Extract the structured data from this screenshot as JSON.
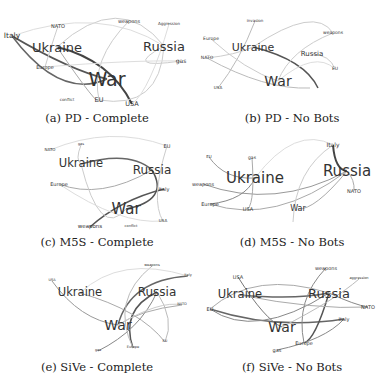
{
  "panels": [
    {
      "id": "a",
      "caption": "(a) PD - Complete",
      "nodes": [
        {
          "label": "Italy",
          "x": 12,
          "y": 36,
          "size": 7.5
        },
        {
          "label": "NATO",
          "x": 58,
          "y": 26,
          "size": 5
        },
        {
          "label": "weapons",
          "x": 129,
          "y": 21,
          "size": 5
        },
        {
          "label": "Aggression",
          "x": 169,
          "y": 24,
          "size": 4
        },
        {
          "label": "Ukraine",
          "x": 57,
          "y": 47,
          "size": 13
        },
        {
          "label": "Russia",
          "x": 164,
          "y": 46,
          "size": 13
        },
        {
          "label": "gas",
          "x": 181,
          "y": 61,
          "size": 6
        },
        {
          "label": "Europe",
          "x": 45,
          "y": 67,
          "size": 5
        },
        {
          "label": "War",
          "x": 107,
          "y": 79,
          "size": 19
        },
        {
          "label": "conflict",
          "x": 67,
          "y": 100,
          "size": 4
        },
        {
          "label": "EU",
          "x": 99,
          "y": 100,
          "size": 6.5
        },
        {
          "label": "USA",
          "x": 132,
          "y": 104,
          "size": 6.5
        }
      ],
      "edges": [
        {
          "d": "M12,36 Q70,70 107,79",
          "w": 2,
          "c": "#555"
        },
        {
          "d": "M12,36 Q60,100 107,79",
          "w": 1.5,
          "c": "#666"
        },
        {
          "d": "M57,47 Q110,60 132,104",
          "w": 2,
          "c": "#444"
        },
        {
          "d": "M57,47 Q120,-10 164,46",
          "w": 1,
          "c": "#ccc"
        },
        {
          "d": "M57,47 Q100,110 99,100",
          "w": 1,
          "c": "#aaa"
        },
        {
          "d": "M164,46 Q120,70 181,61",
          "w": 1,
          "c": "#ccc"
        },
        {
          "d": "M164,46 Q160,110 99,100",
          "w": 1,
          "c": "#ccc"
        },
        {
          "d": "M129,21 Q90,60 99,100",
          "w": 1,
          "c": "#ccc"
        },
        {
          "d": "M45,67 Q130,60 181,61",
          "w": 1,
          "c": "#ddd"
        },
        {
          "d": "M58,26 Q50,50 45,67",
          "w": 1,
          "c": "#ccc"
        },
        {
          "d": "M169,24 Q150,90 132,104",
          "w": 1,
          "c": "#ddd"
        },
        {
          "d": "M12,36 Q100,5 164,46",
          "w": 1,
          "c": "#ddd"
        }
      ]
    },
    {
      "id": "b",
      "caption": "(b) PD - No Bots",
      "nodes": [
        {
          "label": "invasion",
          "x": 60,
          "y": 21,
          "size": 4
        },
        {
          "label": "weapons",
          "x": 138,
          "y": 33,
          "size": 4.5
        },
        {
          "label": "Europe",
          "x": 16,
          "y": 39,
          "size": 4.5
        },
        {
          "label": "Ukraine",
          "x": 58,
          "y": 47,
          "size": 11
        },
        {
          "label": "Russia",
          "x": 117,
          "y": 54,
          "size": 7
        },
        {
          "label": "NATO",
          "x": 12,
          "y": 58,
          "size": 4.5
        },
        {
          "label": "EU",
          "x": 140,
          "y": 69,
          "size": 4.5
        },
        {
          "label": "War",
          "x": 83,
          "y": 81,
          "size": 14
        },
        {
          "label": "USA",
          "x": 23,
          "y": 88,
          "size": 4
        }
      ],
      "edges": [
        {
          "d": "M58,47 Q110,60 123,88",
          "w": 1.5,
          "c": "#555"
        },
        {
          "d": "M58,47 Q120,5 138,33",
          "w": 1,
          "c": "#ccc"
        },
        {
          "d": "M60,21 Q45,60 23,88",
          "w": 1,
          "c": "#bbb"
        },
        {
          "d": "M16,39 Q50,70 83,81",
          "w": 1,
          "c": "#ccc"
        },
        {
          "d": "M12,58 Q70,90 115,88",
          "w": 1,
          "c": "#bbb"
        },
        {
          "d": "M117,54 Q135,55 140,69",
          "w": 1,
          "c": "#ccc"
        },
        {
          "d": "M138,33 Q95,50 83,81",
          "w": 1,
          "c": "#ccc"
        },
        {
          "d": "M12,58 Q40,55 58,47",
          "w": 1,
          "c": "#ccc"
        },
        {
          "d": "M83,81 Q120,50 140,69",
          "w": 1,
          "c": "#ddd"
        }
      ]
    },
    {
      "id": "c",
      "caption": "(c) M5S - Complete",
      "nodes": [
        {
          "label": "NATO",
          "x": 50,
          "y": 20,
          "size": 4
        },
        {
          "label": "gas",
          "x": 81,
          "y": 15,
          "size": 3.5
        },
        {
          "label": "EU",
          "x": 167,
          "y": 16,
          "size": 5
        },
        {
          "label": "Ukraine",
          "x": 81,
          "y": 34,
          "size": 11.5
        },
        {
          "label": "Russia",
          "x": 152,
          "y": 40,
          "size": 12
        },
        {
          "label": "Europe",
          "x": 59,
          "y": 54,
          "size": 5
        },
        {
          "label": "Italy",
          "x": 164,
          "y": 59,
          "size": 5
        },
        {
          "label": "War",
          "x": 126,
          "y": 79,
          "size": 15
        },
        {
          "label": "USA",
          "x": 163,
          "y": 91,
          "size": 4
        },
        {
          "label": "weapons",
          "x": 90,
          "y": 97,
          "size": 5.5
        },
        {
          "label": "conflict",
          "x": 131,
          "y": 97,
          "size": 3.5
        }
      ],
      "edges": [
        {
          "d": "M81,34 Q130,20 152,40",
          "w": 1.5,
          "c": "#666"
        },
        {
          "d": "M152,40 Q170,70 126,79",
          "w": 1.5,
          "c": "#555"
        },
        {
          "d": "M90,97 Q120,70 164,59",
          "w": 1.5,
          "c": "#555"
        },
        {
          "d": "M152,40 Q100,70 59,54",
          "w": 1,
          "c": "#aaa"
        },
        {
          "d": "M81,15 Q75,30 81,34",
          "w": 1,
          "c": "#ccc"
        },
        {
          "d": "M50,20 Q110,-5 167,16",
          "w": 1,
          "c": "#ddd"
        },
        {
          "d": "M167,16 Q150,70 163,91",
          "w": 1,
          "c": "#ccc"
        },
        {
          "d": "M81,34 Q100,110 126,79",
          "w": 1,
          "c": "#ccc"
        },
        {
          "d": "M59,54 Q120,95 163,91",
          "w": 1,
          "c": "#ddd"
        }
      ]
    },
    {
      "id": "d",
      "caption": "(d) M5S - No Bots",
      "nodes": [
        {
          "label": "Italy",
          "x": 138,
          "y": 15,
          "size": 6
        },
        {
          "label": "EU",
          "x": 14,
          "y": 27,
          "size": 4
        },
        {
          "label": "gas",
          "x": 57,
          "y": 28,
          "size": 4.5
        },
        {
          "label": "Ukraine",
          "x": 60,
          "y": 48,
          "size": 15
        },
        {
          "label": "Russia",
          "x": 152,
          "y": 41,
          "size": 15
        },
        {
          "label": "weapons",
          "x": 8,
          "y": 54,
          "size": 5
        },
        {
          "label": "NATO",
          "x": 159,
          "y": 61,
          "size": 5
        },
        {
          "label": "Europe",
          "x": 15,
          "y": 74,
          "size": 5
        },
        {
          "label": "USA",
          "x": 53,
          "y": 79,
          "size": 5
        },
        {
          "label": "War",
          "x": 103,
          "y": 79,
          "size": 8
        }
      ],
      "edges": [
        {
          "d": "M138,15 Q140,40 152,41",
          "w": 2,
          "c": "#444"
        },
        {
          "d": "M152,41 Q80,80 8,54",
          "w": 1,
          "c": "#999"
        },
        {
          "d": "M152,41 Q80,95 15,74",
          "w": 1,
          "c": "#aaa"
        },
        {
          "d": "M152,41 Q120,80 103,79",
          "w": 1,
          "c": "#aaa"
        },
        {
          "d": "M14,27 Q30,50 60,48",
          "w": 1,
          "c": "#999"
        },
        {
          "d": "M60,48 Q50,70 15,74",
          "w": 1,
          "c": "#888"
        },
        {
          "d": "M57,28 Q60,70 53,79",
          "w": 1,
          "c": "#aaa"
        },
        {
          "d": "M138,15 Q100,40 98,92",
          "w": 1,
          "c": "#ccc"
        },
        {
          "d": "M60,48 Q100,-5 138,15",
          "w": 1,
          "c": "#ddd"
        },
        {
          "d": "M152,41 Q160,50 159,61",
          "w": 1,
          "c": "#aaa"
        }
      ]
    },
    {
      "id": "e",
      "caption": "(e) SiVe - Complete",
      "nodes": [
        {
          "label": "weapons",
          "x": 152,
          "y": 6,
          "size": 3.5
        },
        {
          "label": "USA",
          "x": 52,
          "y": 21,
          "size": 3.5
        },
        {
          "label": "Italy",
          "x": 188,
          "y": 16,
          "size": 3.5
        },
        {
          "label": "Ukraine",
          "x": 80,
          "y": 33,
          "size": 11.5
        },
        {
          "label": "Russia",
          "x": 157,
          "y": 32,
          "size": 12
        },
        {
          "label": "NATO",
          "x": 182,
          "y": 45,
          "size": 3.5
        },
        {
          "label": "War",
          "x": 118,
          "y": 65,
          "size": 14
        },
        {
          "label": "EU",
          "x": 165,
          "y": 82,
          "size": 3.5
        },
        {
          "label": "gas",
          "x": 98,
          "y": 91,
          "size": 3.5
        },
        {
          "label": "Europe",
          "x": 133,
          "y": 88,
          "size": 3.5
        }
      ],
      "edges": [
        {
          "d": "M157,32 Q120,50 133,88",
          "w": 1.5,
          "c": "#555"
        },
        {
          "d": "M188,16 Q130,20 118,65",
          "w": 1.5,
          "c": "#666"
        },
        {
          "d": "M52,21 Q80,60 118,65",
          "w": 1,
          "c": "#999"
        },
        {
          "d": "M80,33 Q140,50 165,82",
          "w": 1,
          "c": "#aaa"
        },
        {
          "d": "M98,91 Q140,70 157,32",
          "w": 1,
          "c": "#888"
        },
        {
          "d": "M152,6 Q110,40 133,88",
          "w": 1,
          "c": "#bbb"
        },
        {
          "d": "M80,33 Q120,-5 188,16",
          "w": 1,
          "c": "#ddd"
        },
        {
          "d": "M182,45 Q140,50 118,65",
          "w": 1,
          "c": "#aaa"
        },
        {
          "d": "M157,32 Q175,60 165,82",
          "w": 1,
          "c": "#bbb"
        },
        {
          "d": "M118,65 Q160,40 182,45",
          "w": 1,
          "c": "#ccc"
        }
      ]
    },
    {
      "id": "f",
      "caption": "(f) SiVe - No Bots",
      "nodes": [
        {
          "label": "weapons",
          "x": 131,
          "y": 8,
          "size": 5
        },
        {
          "label": "USA",
          "x": 43,
          "y": 17,
          "size": 5
        },
        {
          "label": "aggression",
          "x": 164,
          "y": 19,
          "size": 3.5
        },
        {
          "label": "Ukraine",
          "x": 45,
          "y": 35,
          "size": 11.5
        },
        {
          "label": "Russia",
          "x": 134,
          "y": 33,
          "size": 13
        },
        {
          "label": "EU",
          "x": 15,
          "y": 49,
          "size": 5
        },
        {
          "label": "NATO",
          "x": 173,
          "y": 47,
          "size": 5
        },
        {
          "label": "Italy",
          "x": 149,
          "y": 59,
          "size": 5
        },
        {
          "label": "War",
          "x": 87,
          "y": 67,
          "size": 14
        },
        {
          "label": "Europe",
          "x": 109,
          "y": 83,
          "size": 5
        },
        {
          "label": "gas",
          "x": 82,
          "y": 90,
          "size": 5
        }
      ],
      "edges": [
        {
          "d": "M45,35 Q100,40 134,33",
          "w": 1.5,
          "c": "#666"
        },
        {
          "d": "M15,49 Q80,70 149,59",
          "w": 1.5,
          "c": "#666"
        },
        {
          "d": "M43,17 Q70,60 87,67",
          "w": 1,
          "c": "#777"
        },
        {
          "d": "M134,33 Q120,80 109,83",
          "w": 1.5,
          "c": "#555"
        },
        {
          "d": "M131,8 Q100,40 109,83",
          "w": 1,
          "c": "#888"
        },
        {
          "d": "M15,49 Q60,80 134,33",
          "w": 1,
          "c": "#888"
        },
        {
          "d": "M82,90 Q130,80 149,59",
          "w": 1,
          "c": "#888"
        },
        {
          "d": "M134,33 Q160,45 173,47",
          "w": 1,
          "c": "#888"
        },
        {
          "d": "M15,49 Q60,10 134,33",
          "w": 1,
          "c": "#aaa"
        },
        {
          "d": "M45,35 Q120,50 173,47",
          "w": 1,
          "c": "#aaa"
        },
        {
          "d": "M87,67 Q140,40 164,19",
          "w": 1,
          "c": "#bbb"
        }
      ]
    }
  ]
}
